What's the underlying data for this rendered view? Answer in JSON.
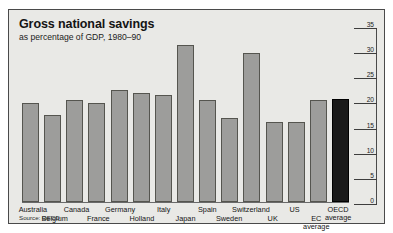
{
  "chart_data": {
    "type": "bar",
    "title": "Gross national savings",
    "subtitle": "as percentage of GDP, 1980–90",
    "source": "Source: OECD",
    "xlabel": "",
    "ylabel": "",
    "ylim": [
      0,
      35
    ],
    "yticks": [
      0,
      5,
      10,
      15,
      20,
      25,
      30,
      35
    ],
    "grid": false,
    "legend": "none",
    "categories": [
      "Australia",
      "Belgium",
      "Canada",
      "France",
      "Germany",
      "Holland",
      "Italy",
      "Japan",
      "Spain",
      "Sweden",
      "Switzerland",
      "UK",
      "US",
      "EC average",
      "OECD average"
    ],
    "values": [
      20.0,
      17.5,
      20.5,
      20.0,
      22.5,
      22.0,
      21.5,
      31.5,
      20.5,
      17.0,
      30.0,
      16.0,
      16.0,
      20.5,
      20.8
    ],
    "bars": [
      {
        "label": "Australia",
        "value": 20.0,
        "label_row": 0,
        "highlight": false
      },
      {
        "label": "Belgium",
        "value": 17.5,
        "label_row": 1,
        "highlight": false
      },
      {
        "label": "Canada",
        "value": 20.5,
        "label_row": 0,
        "highlight": false
      },
      {
        "label": "France",
        "value": 20.0,
        "label_row": 1,
        "highlight": false
      },
      {
        "label": "Germany",
        "value": 22.5,
        "label_row": 0,
        "highlight": false
      },
      {
        "label": "Holland",
        "value": 22.0,
        "label_row": 1,
        "highlight": false
      },
      {
        "label": "Italy",
        "value": 21.5,
        "label_row": 0,
        "highlight": false
      },
      {
        "label": "Japan",
        "value": 31.5,
        "label_row": 1,
        "highlight": false
      },
      {
        "label": "Spain",
        "value": 20.5,
        "label_row": 0,
        "highlight": false
      },
      {
        "label": "Sweden",
        "value": 17.0,
        "label_row": 1,
        "highlight": false
      },
      {
        "label": "Switzerland",
        "value": 30.0,
        "label_row": 0,
        "highlight": false
      },
      {
        "label": "UK",
        "value": 16.0,
        "label_row": 1,
        "highlight": false
      },
      {
        "label": "US",
        "value": 16.0,
        "label_row": 0,
        "highlight": false
      },
      {
        "label": "EC average",
        "value": 20.5,
        "label_row": 1,
        "highlight": false
      },
      {
        "label": "OECD average",
        "value": 20.8,
        "label_row": 0,
        "highlight": true
      }
    ],
    "colors": {
      "bar_fill": "#9d9d9b",
      "bar_stroke": "#55554f",
      "highlight_fill": "#1a1a1a",
      "panel_background": "#e9e9e6",
      "frame_stroke": "#4a4a4a",
      "text": "#141414"
    }
  }
}
